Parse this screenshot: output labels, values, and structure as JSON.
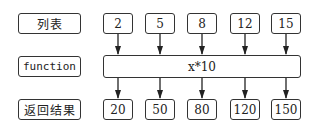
{
  "rows": {
    "input_label": "列表",
    "function_label": "function",
    "output_label": "返回结果"
  },
  "inputs": [
    "2",
    "5",
    "8",
    "12",
    "15"
  ],
  "function_expr": "x*10",
  "outputs": [
    "20",
    "50",
    "80",
    "120",
    "150"
  ]
}
